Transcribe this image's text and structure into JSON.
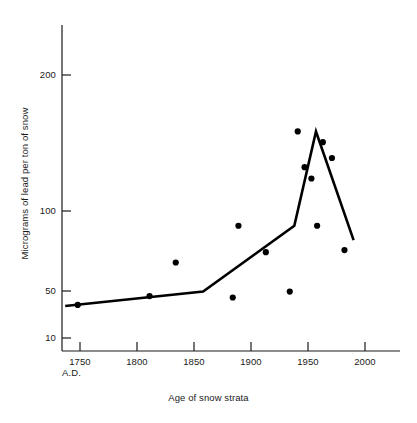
{
  "chart_data": {
    "type": "scatter",
    "title": "",
    "subtitle": "",
    "xlabel": "Age of snow strata",
    "ylabel": "Micrograms of lead per ton of snow",
    "era_label": "A.D.",
    "xlim": [
      1735,
      2015
    ],
    "ylim": [
      10,
      290
    ],
    "yscale": "log",
    "grid": false,
    "legend": null,
    "xticks": [
      1750,
      1800,
      1850,
      1900,
      1950,
      2000
    ],
    "xticklabels": [
      "1750",
      "1800",
      "1850",
      "1900",
      "1950",
      "2000"
    ],
    "yticks": [
      10,
      50,
      100,
      200
    ],
    "yticklabels": [
      "10",
      "50",
      "100",
      "200"
    ],
    "series": [
      {
        "name": "Measured lead concentration",
        "type": "scatter",
        "marker": "filled-circle",
        "color": "#000000",
        "points": [
          {
            "x": 1748,
            "y": 31
          },
          {
            "x": 1811,
            "y": 42
          },
          {
            "x": 1834,
            "y": 64
          },
          {
            "x": 1884,
            "y": 40
          },
          {
            "x": 1889,
            "y": 88
          },
          {
            "x": 1913,
            "y": 70
          },
          {
            "x": 1934,
            "y": 49
          },
          {
            "x": 1941,
            "y": 150
          },
          {
            "x": 1947,
            "y": 125
          },
          {
            "x": 1953,
            "y": 118
          },
          {
            "x": 1958,
            "y": 88
          },
          {
            "x": 1963,
            "y": 142
          },
          {
            "x": 1971,
            "y": 131
          },
          {
            "x": 1982,
            "y": 203
          }
        ]
      },
      {
        "name": "Fitted trend line",
        "type": "line",
        "color": "#000000",
        "points": [
          {
            "x": 1737,
            "y": 30
          },
          {
            "x": 1858,
            "y": 49
          },
          {
            "x": 1938,
            "y": 88
          },
          {
            "x": 1957,
            "y": 150
          },
          {
            "x": 1990,
            "y": 285
          }
        ]
      }
    ],
    "colors": {
      "axis": "#1a1a1a",
      "marker": "#000000",
      "line": "#000000",
      "background": "#ffffff"
    }
  },
  "axes": {
    "y_ticks": [
      {
        "label": "200",
        "px": 75
      },
      {
        "label": "100",
        "px": 211
      },
      {
        "label": "50",
        "px": 291
      },
      {
        "label": "10",
        "px": 338
      }
    ],
    "x_ticks": [
      {
        "label": "1750",
        "px": 80
      },
      {
        "label": "1800",
        "px": 137
      },
      {
        "label": "1850",
        "px": 194
      },
      {
        "label": "1900",
        "px": 251
      },
      {
        "label": "1950",
        "px": 308
      },
      {
        "label": "2000",
        "px": 365
      }
    ]
  }
}
